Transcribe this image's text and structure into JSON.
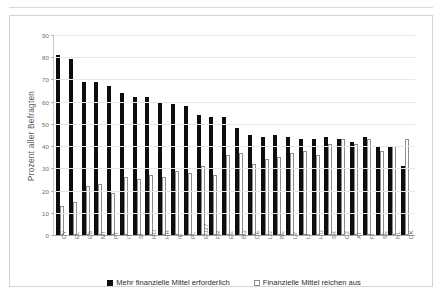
{
  "chart_data": {
    "type": "bar",
    "title": "",
    "xlabel": "",
    "ylabel": "Prozent aller Befragten",
    "ylim": [
      0,
      90
    ],
    "yticks": [
      0,
      10,
      20,
      30,
      40,
      50,
      60,
      70,
      80,
      90
    ],
    "grid": true,
    "legend_position": "bottom",
    "categories": [
      "CY",
      "EL",
      "ES",
      "MT",
      "PT",
      "IT",
      "SI",
      "RO",
      "HR",
      "IE",
      "PL",
      "EU27",
      "FR",
      "EE",
      "BG",
      "DE",
      "LU",
      "BE",
      "LV",
      "LT",
      "HU",
      "SK",
      "CZ",
      "AT",
      "FI",
      "SE",
      "NL",
      "DK"
    ],
    "series": [
      {
        "name": "Mehr finanzielle Mittel erforderlich",
        "color": "#0d0d0d",
        "values": [
          81,
          79,
          69,
          69,
          67,
          64,
          62,
          62,
          60,
          59,
          58,
          54,
          53,
          53,
          48,
          45,
          44,
          45,
          44,
          43,
          43,
          44,
          43,
          42,
          44,
          40,
          40,
          31
        ]
      },
      {
        "name": "Finanzielle Mittel reichen  aus",
        "color": "#ffffff",
        "values": [
          13,
          15,
          22,
          23,
          19,
          26,
          25,
          27,
          26,
          29,
          28,
          31,
          27,
          36,
          37,
          32,
          34,
          35,
          37,
          38,
          36,
          41,
          43,
          41,
          43,
          38,
          40,
          43
        ]
      }
    ]
  },
  "legend": {
    "items": [
      {
        "label": "Mehr finanzielle Mittel erforderlich",
        "style": "dark"
      },
      {
        "label": "Finanzielle Mittel reichen  aus",
        "style": "light"
      }
    ]
  },
  "axis": {
    "y_title": "Prozent aller Befragten"
  }
}
